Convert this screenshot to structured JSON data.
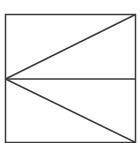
{
  "diagram": {
    "type": "geometric-figure",
    "stroke_color": "#3a3a3a",
    "background_color": "#ffffff",
    "shapes": {
      "square": {
        "x": 5.5,
        "y": 14.5,
        "width": 130,
        "height": 128
      },
      "midline": {
        "x1": 5.5,
        "y1": 79,
        "x2": 135.5,
        "y2": 79
      },
      "upper_diagonal": {
        "x1": 5.5,
        "y1": 79,
        "x2": 135.5,
        "y2": 14.5
      },
      "lower_diagonal": {
        "x1": 5.5,
        "y1": 79,
        "x2": 135.5,
        "y2": 142.5
      }
    }
  }
}
